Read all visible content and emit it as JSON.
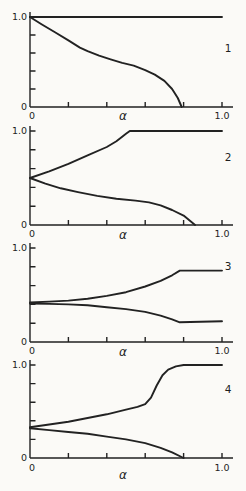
{
  "figure": {
    "colors": {
      "background": "#fbfaf7",
      "line": "#222222"
    }
  },
  "chart_data": [
    {
      "type": "line",
      "panel_label": "1",
      "xlabel": "α",
      "ylabel": "",
      "xlim": [
        0,
        1.0
      ],
      "ylim": [
        0,
        1.0
      ],
      "x_ticks": [
        0,
        0.2,
        0.4,
        0.6,
        0.8,
        1.0
      ],
      "y_ticks": [
        0,
        0.2,
        0.4,
        0.6,
        0.8,
        1.0
      ],
      "x_min_label": "0",
      "x_max_label": "1.0",
      "y_min_label": "0",
      "y_max_label": "1.0",
      "grid": false,
      "series": [
        {
          "name": "constant-upper",
          "points": [
            [
              0,
              1.0
            ],
            [
              1.0,
              1.0
            ]
          ]
        },
        {
          "name": "descending-curve",
          "points": [
            [
              0,
              1.0
            ],
            [
              0.06,
              0.92
            ],
            [
              0.13,
              0.83
            ],
            [
              0.2,
              0.74
            ],
            [
              0.26,
              0.66
            ],
            [
              0.3,
              0.62
            ],
            [
              0.36,
              0.57
            ],
            [
              0.42,
              0.53
            ],
            [
              0.48,
              0.49
            ],
            [
              0.54,
              0.46
            ],
            [
              0.6,
              0.41
            ],
            [
              0.65,
              0.36
            ],
            [
              0.7,
              0.29
            ],
            [
              0.74,
              0.2
            ],
            [
              0.77,
              0.1
            ],
            [
              0.79,
              0.0
            ]
          ]
        }
      ]
    },
    {
      "type": "line",
      "panel_label": "2",
      "xlabel": "α",
      "ylabel": "",
      "xlim": [
        0,
        1.0
      ],
      "ylim": [
        0,
        1.0
      ],
      "x_ticks": [
        0,
        0.2,
        0.4,
        0.6,
        0.8,
        1.0
      ],
      "y_ticks": [
        0,
        0.2,
        0.4,
        0.6,
        0.8,
        1.0
      ],
      "x_min_label": "0",
      "x_max_label": "1.0",
      "y_min_label": "0",
      "y_max_label": "1.0",
      "grid": false,
      "series": [
        {
          "name": "upper-branch",
          "points": [
            [
              0,
              0.5
            ],
            [
              0.1,
              0.57
            ],
            [
              0.2,
              0.65
            ],
            [
              0.3,
              0.74
            ],
            [
              0.4,
              0.83
            ],
            [
              0.45,
              0.89
            ],
            [
              0.5,
              0.97
            ],
            [
              0.52,
              1.0
            ],
            [
              1.0,
              1.0
            ]
          ]
        },
        {
          "name": "lower-branch",
          "points": [
            [
              0,
              0.5
            ],
            [
              0.08,
              0.44
            ],
            [
              0.16,
              0.39
            ],
            [
              0.25,
              0.35
            ],
            [
              0.35,
              0.31
            ],
            [
              0.45,
              0.28
            ],
            [
              0.55,
              0.26
            ],
            [
              0.62,
              0.24
            ],
            [
              0.68,
              0.21
            ],
            [
              0.74,
              0.16
            ],
            [
              0.8,
              0.1
            ],
            [
              0.86,
              0.0
            ]
          ]
        }
      ]
    },
    {
      "type": "line",
      "panel_label": "3",
      "xlabel": "α",
      "ylabel": "",
      "xlim": [
        0,
        1.0
      ],
      "ylim": [
        0,
        1.0
      ],
      "x_ticks": [
        0,
        0.2,
        0.4,
        0.6,
        0.8,
        1.0
      ],
      "y_ticks": [
        0,
        0.2,
        0.4,
        0.6,
        0.8,
        1.0
      ],
      "x_min_label": "0",
      "x_max_label": "1.0",
      "y_min_label": "0",
      "y_max_label": "1.0",
      "grid": false,
      "series": [
        {
          "name": "upper-branch",
          "points": [
            [
              0,
              0.42
            ],
            [
              0.1,
              0.43
            ],
            [
              0.2,
              0.44
            ],
            [
              0.3,
              0.46
            ],
            [
              0.4,
              0.49
            ],
            [
              0.5,
              0.53
            ],
            [
              0.6,
              0.59
            ],
            [
              0.68,
              0.65
            ],
            [
              0.74,
              0.71
            ],
            [
              0.78,
              0.76
            ],
            [
              1.0,
              0.76
            ]
          ]
        },
        {
          "name": "lower-branch",
          "points": [
            [
              0,
              0.41
            ],
            [
              0.1,
              0.405
            ],
            [
              0.2,
              0.4
            ],
            [
              0.3,
              0.39
            ],
            [
              0.4,
              0.37
            ],
            [
              0.5,
              0.35
            ],
            [
              0.6,
              0.32
            ],
            [
              0.68,
              0.28
            ],
            [
              0.74,
              0.24
            ],
            [
              0.78,
              0.21
            ],
            [
              1.0,
              0.22
            ]
          ]
        }
      ]
    },
    {
      "type": "line",
      "panel_label": "4",
      "xlabel": "α",
      "ylabel": "",
      "xlim": [
        0,
        1.0
      ],
      "ylim": [
        0,
        1.0
      ],
      "x_ticks": [
        0,
        0.2,
        0.4,
        0.6,
        0.8,
        1.0
      ],
      "y_ticks": [
        0,
        0.2,
        0.4,
        0.6,
        0.8,
        1.0
      ],
      "x_min_label": "0",
      "x_max_label": "1.0",
      "y_min_label": "0",
      "y_max_label": "1.0",
      "grid": false,
      "series": [
        {
          "name": "upper-branch",
          "points": [
            [
              0,
              0.33
            ],
            [
              0.1,
              0.36
            ],
            [
              0.2,
              0.39
            ],
            [
              0.3,
              0.43
            ],
            [
              0.4,
              0.47
            ],
            [
              0.5,
              0.52
            ],
            [
              0.56,
              0.55
            ],
            [
              0.6,
              0.58
            ],
            [
              0.63,
              0.65
            ],
            [
              0.66,
              0.78
            ],
            [
              0.69,
              0.89
            ],
            [
              0.72,
              0.95
            ],
            [
              0.76,
              0.985
            ],
            [
              0.8,
              1.0
            ],
            [
              1.0,
              1.0
            ]
          ]
        },
        {
          "name": "lower-branch",
          "points": [
            [
              0,
              0.32
            ],
            [
              0.1,
              0.3
            ],
            [
              0.2,
              0.28
            ],
            [
              0.3,
              0.26
            ],
            [
              0.4,
              0.23
            ],
            [
              0.5,
              0.2
            ],
            [
              0.6,
              0.16
            ],
            [
              0.68,
              0.11
            ],
            [
              0.74,
              0.06
            ],
            [
              0.8,
              0.0
            ]
          ]
        }
      ]
    }
  ]
}
